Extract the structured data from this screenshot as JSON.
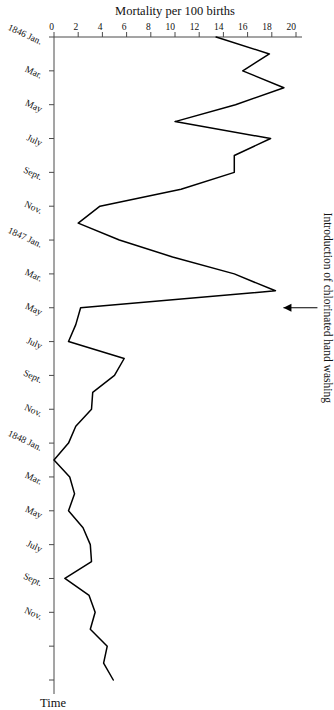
{
  "figure": {
    "rotation_degrees": 90,
    "background_color": "#ffffff",
    "line_color": "#000000",
    "axis_color": "#4a4a4a"
  },
  "annotation": {
    "text": "Introduction of chlorinated hand washing",
    "arrow": "right-arrow-icon"
  },
  "axes": {
    "value_axis_title": "Mortality per 100 births",
    "time_axis_title": "Time",
    "value_ticks": [
      "0",
      "2",
      "4",
      "6",
      "8",
      "10",
      "12",
      "14",
      "16",
      "18",
      "20"
    ],
    "value_tick_numbers": [
      0,
      2,
      4,
      6,
      8,
      10,
      12,
      14,
      16,
      18,
      20
    ],
    "time_ticks": [
      "1846 Jan.",
      "Mar.",
      "May",
      "July",
      "Sept.",
      "Nov.",
      "1847 Jan.",
      "Mar.",
      "May",
      "July",
      "Sept.",
      "Nov.",
      "1848 Jan.",
      "Mar.",
      "May",
      "July",
      "Sept.",
      "Nov."
    ]
  },
  "chart_data": {
    "type": "line",
    "title": "",
    "subtitle": "",
    "xlabel": "Time",
    "ylabel": "Mortality per 100 births",
    "xlim": [
      "1846 Jan.",
      "1849 Mar."
    ],
    "ylim": [
      0,
      20
    ],
    "grid": false,
    "legend_position": "none",
    "annotations": [
      {
        "text": "Introduction of chlorinated hand washing",
        "points_at_x": "1847 May",
        "points_at_y": 18.3
      }
    ],
    "x": [
      "1846 Jan.",
      "1846 Feb.",
      "1846 Mar.",
      "1846 Apr.",
      "1846 May",
      "1846 June",
      "1846 July",
      "1846 Aug.",
      "1846 Sept.",
      "1846 Oct.",
      "1846 Nov.",
      "1846 Dec.",
      "1847 Jan.",
      "1847 Feb.",
      "1847 Mar.",
      "1847 Apr.",
      "1847 May",
      "1847 June",
      "1847 July",
      "1847 Aug.",
      "1847 Sept.",
      "1847 Oct.",
      "1847 Nov.",
      "1847 Dec.",
      "1848 Jan.",
      "1848 Feb.",
      "1848 Mar.",
      "1848 Apr.",
      "1848 May",
      "1848 June",
      "1848 July",
      "1848 Aug.",
      "1848 Sept.",
      "1848 Oct.",
      "1848 Nov.",
      "1848 Dec.",
      "1849 Jan.",
      "1849 Feb.",
      "1849 Mar."
    ],
    "values": [
      13.4,
      17.8,
      15.6,
      19.0,
      15.0,
      10.0,
      17.9,
      14.9,
      14.9,
      10.5,
      3.8,
      2.0,
      5.4,
      9.8,
      14.9,
      18.3,
      2.2,
      1.8,
      1.2,
      5.8,
      5.0,
      3.2,
      3.1,
      1.8,
      1.2,
      0.0,
      1.3,
      1.7,
      1.2,
      2.4,
      3.0,
      3.1,
      0.9,
      2.9,
      3.4,
      3.0,
      4.4,
      4.1,
      4.9
    ],
    "series": [
      {
        "name": "Mortality per 100 births",
        "values": [
          13.4,
          17.8,
          15.6,
          19.0,
          15.0,
          10.0,
          17.9,
          14.9,
          14.9,
          10.5,
          3.8,
          2.0,
          5.4,
          9.8,
          14.9,
          18.3,
          2.2,
          1.8,
          1.2,
          5.8,
          5.0,
          3.2,
          3.1,
          1.8,
          1.2,
          0.0,
          1.3,
          1.7,
          1.2,
          2.4,
          3.0,
          3.1,
          0.9,
          2.9,
          3.4,
          3.0,
          4.4,
          4.1,
          4.9
        ]
      }
    ]
  }
}
